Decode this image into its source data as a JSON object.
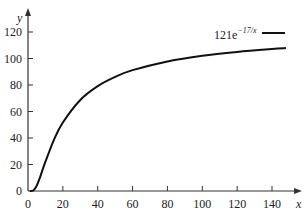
{
  "chart_data": {
    "type": "line",
    "title": "",
    "xlabel": "x",
    "ylabel": "y",
    "xlim": [
      0,
      150
    ],
    "ylim": [
      0,
      130
    ],
    "grid": false,
    "legend_position": "top-right",
    "x_ticks": [
      0,
      20,
      40,
      60,
      80,
      100,
      120,
      140
    ],
    "y_ticks": [
      0,
      20,
      40,
      60,
      80,
      100,
      120
    ],
    "x_tick_labels": [
      "0",
      "20",
      "40",
      "60",
      "80",
      "100",
      "120",
      "140"
    ],
    "y_tick_labels": [
      "0",
      "20",
      "40",
      "60",
      "80",
      "100",
      "120"
    ],
    "series": [
      {
        "name": "121e^{-17/x}",
        "legend_base": "121e",
        "legend_exponent": "−17/x",
        "color": "#111111",
        "x": [
          1,
          3,
          5,
          7,
          10,
          15,
          20,
          30,
          40,
          50,
          60,
          80,
          100,
          120,
          140,
          148
        ],
        "values": [
          0.0,
          0.4,
          4.0,
          10.7,
          22.1,
          39.0,
          51.7,
          68.7,
          79.1,
          86.1,
          91.2,
          97.8,
          102.1,
          105.0,
          107.2,
          107.9
        ]
      }
    ]
  },
  "labels": {
    "x_axis": "x",
    "y_axis": "y",
    "legend_base": "121e",
    "legend_exponent": "−17/x"
  }
}
